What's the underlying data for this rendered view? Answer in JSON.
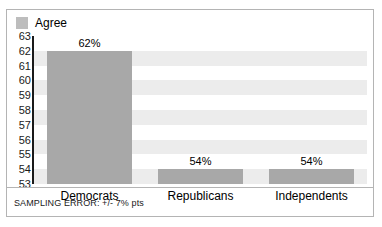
{
  "legend": {
    "swatch_color": "#bdbdbd",
    "label": "Agree"
  },
  "footnote": "SAMPLING ERROR: +/- 7% pts",
  "chart_data": {
    "type": "bar",
    "title": "",
    "subtitle": "",
    "xlabel": "",
    "ylabel": "",
    "categories": [
      "Democrats",
      "Republicans",
      "Independents"
    ],
    "values": [
      62,
      54,
      54
    ],
    "data_labels": [
      "62%",
      "54%",
      "54%"
    ],
    "series": [
      {
        "name": "Agree",
        "values": [
          62,
          54,
          54
        ],
        "color": "#a8a8a8"
      }
    ],
    "ylim": [
      53,
      63
    ],
    "ytick_step": 1,
    "yticks": [
      63,
      62,
      61,
      60,
      59,
      58,
      57,
      56,
      55,
      54,
      53
    ],
    "ytick_labels": [
      "63",
      "62",
      "61",
      "60",
      "59",
      "58",
      "57",
      "56",
      "55",
      "54",
      "53"
    ],
    "grid": "horizontal-bands",
    "band_color": "#ececec",
    "legend_position": "top-left",
    "annotations": [
      "SAMPLING ERROR: +/- 7% pts"
    ]
  }
}
